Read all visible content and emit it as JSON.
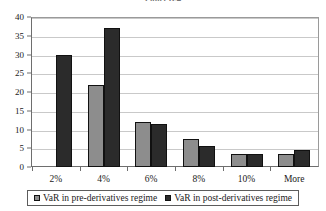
{
  "title": "Panel B.4",
  "legend": {
    "position": "bottom",
    "entries": [
      {
        "label": "VaR in pre-derivatives regime",
        "swatch": "legend-swatch-pre",
        "color": "#8d8d8d"
      },
      {
        "label": "VaR in post-derivatives regime",
        "swatch": "legend-swatch-post",
        "color": "#2b2b2b"
      }
    ]
  },
  "axes": {
    "y_ticks": [
      "0",
      "5",
      "10",
      "15",
      "20",
      "25",
      "30",
      "35",
      "40"
    ],
    "x_ticks": [
      "2%",
      "4%",
      "6%",
      "8%",
      "10%",
      "More"
    ]
  },
  "chart_data": {
    "type": "bar",
    "title": "Panel B.4",
    "subtitle": "",
    "xlabel": "",
    "ylabel": "",
    "categories": [
      "2%",
      "4%",
      "6%",
      "8%",
      "10%",
      "More"
    ],
    "series": [
      {
        "name": "VaR in pre-derivatives regime",
        "color": "#8d8d8d",
        "values": [
          0,
          22,
          12,
          7.5,
          3.5,
          3.5
        ]
      },
      {
        "name": "VaR in post-derivatives regime",
        "color": "#2b2b2b",
        "values": [
          30,
          37,
          11.5,
          5.5,
          3.5,
          4.5
        ]
      }
    ],
    "ylim": [
      0,
      40
    ],
    "ytick_step": 5,
    "grid": true,
    "grid_axis": "y",
    "legend_position": "bottom",
    "bar_group_mode": "grouped"
  }
}
